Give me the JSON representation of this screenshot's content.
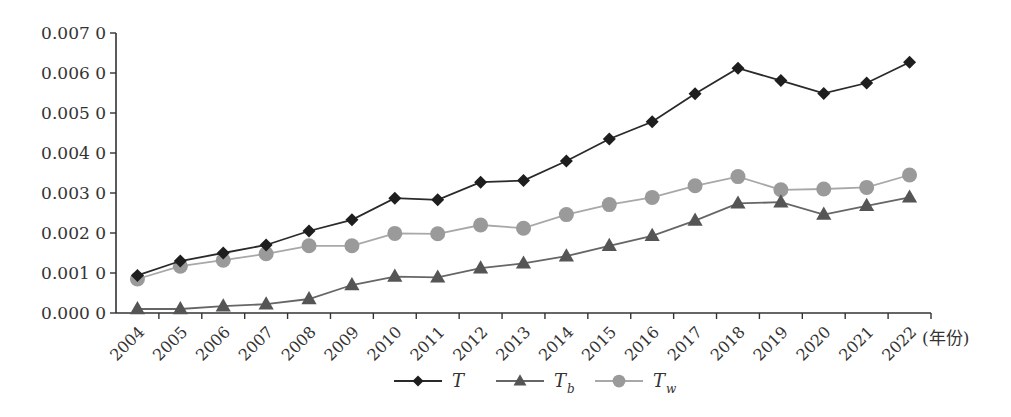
{
  "chart_data": {
    "type": "line",
    "title": "",
    "xlabel": "(年份)",
    "ylabel": "",
    "ylim": [
      0.0,
      0.007
    ],
    "yticks": [
      "0.000 0",
      "0.001 0",
      "0.002 0",
      "0.003 0",
      "0.004 0",
      "0.005 0",
      "0.006 0",
      "0.007 0"
    ],
    "grid": false,
    "legend_position": "bottom",
    "categories": [
      "2004",
      "2005",
      "2006",
      "2007",
      "2008",
      "2009",
      "2010",
      "2011",
      "2012",
      "2013",
      "2014",
      "2015",
      "2016",
      "2017",
      "2018",
      "2019",
      "2020",
      "2021",
      "2022"
    ],
    "series": [
      {
        "name": "T",
        "label_main": "T",
        "label_sub": "",
        "marker": "diamond",
        "color": "#1e1e1e",
        "line_color": "#2a2a2a",
        "values": [
          0.00094,
          0.0013,
          0.0015,
          0.0017,
          0.00205,
          0.00233,
          0.00287,
          0.00283,
          0.00327,
          0.00331,
          0.0038,
          0.00435,
          0.00478,
          0.00548,
          0.00612,
          0.00581,
          0.00549,
          0.00575,
          0.00627
        ]
      },
      {
        "name": "T_b",
        "label_main": "T",
        "label_sub": "b",
        "marker": "triangle",
        "color": "#555555",
        "line_color": "#666666",
        "values": [
          0.0001,
          0.0001,
          0.00017,
          0.00022,
          0.00035,
          0.0007,
          0.00091,
          0.00089,
          0.00112,
          0.00124,
          0.00142,
          0.00168,
          0.00193,
          0.00231,
          0.00274,
          0.00277,
          0.00246,
          0.00268,
          0.00289
        ]
      },
      {
        "name": "T_w",
        "label_main": "T",
        "label_sub": "w",
        "marker": "circle",
        "color": "#9a9a9a",
        "line_color": "#a8a8a8",
        "values": [
          0.00085,
          0.00117,
          0.00132,
          0.00148,
          0.00168,
          0.00168,
          0.00199,
          0.00198,
          0.0022,
          0.00212,
          0.00246,
          0.00271,
          0.00289,
          0.00318,
          0.00341,
          0.00308,
          0.0031,
          0.00314,
          0.00345
        ]
      }
    ]
  }
}
